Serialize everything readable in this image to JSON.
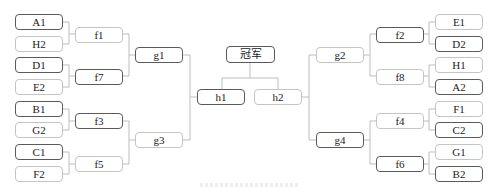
{
  "diagram": {
    "type": "tournament-bracket",
    "champion": "冠军",
    "left": {
      "round1": [
        "A1",
        "H2",
        "D1",
        "E2",
        "B1",
        "G2",
        "C1",
        "F2"
      ],
      "round2": [
        "f1",
        "f7",
        "f3",
        "f5"
      ],
      "round3": [
        "g1",
        "g3"
      ],
      "semifinal": "h1"
    },
    "right": {
      "round1": [
        "E1",
        "D2",
        "H1",
        "A2",
        "F1",
        "C2",
        "G1",
        "B2"
      ],
      "round2": [
        "f2",
        "f8",
        "f4",
        "f6"
      ],
      "round3": [
        "g2",
        "g4"
      ],
      "semifinal": "h2"
    },
    "colors": {
      "dark_border": "#5a5a5a",
      "light_border": "#c4c4c4",
      "connector": "#bdbdbd"
    }
  }
}
